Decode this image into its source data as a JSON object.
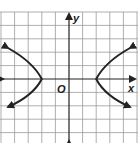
{
  "graph": {
    "x_label": "x",
    "y_label": "y",
    "origin_label": "O",
    "grid_color": "#9a9a9a",
    "curve_color": "#222222",
    "grid": {
      "x_min": -5,
      "x_max": 5,
      "y_min": -5,
      "y_max": 5
    },
    "curve": "hyperbola opening left and right, vertices at (-3,0) and (3,0)"
  }
}
